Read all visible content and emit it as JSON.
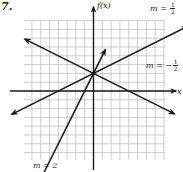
{
  "problem_number": "7.",
  "chart_data": {
    "type": "line",
    "title": "",
    "xlabel": "x",
    "ylabel": "f(x)",
    "grid": true,
    "xlim": [
      -8,
      8
    ],
    "ylim": [
      -8,
      8
    ],
    "y_intercept": 2,
    "series": [
      {
        "name": "m = 1/2",
        "slope": 0.5,
        "intercept": 2,
        "label_text": "m = ",
        "label_num": "1",
        "label_den": "2",
        "label_sign": ""
      },
      {
        "name": "m = -1/2",
        "slope": -0.5,
        "intercept": 2,
        "label_text": "m = −",
        "label_num": "1",
        "label_den": "2",
        "label_sign": "−"
      },
      {
        "name": "m = 2",
        "slope": 2,
        "intercept": 2,
        "label_text": "m = 2"
      }
    ]
  },
  "labels": {
    "y_axis": "f(x)",
    "x_axis": "x",
    "m_half": "m = ",
    "m_neg_half": "m = −",
    "m_two": "m = 2",
    "frac_num": "1",
    "frac_den": "2"
  },
  "colors": {
    "grid": "#b8b8b8",
    "axis": "#1a1a1a",
    "line": "#1a1a1a"
  }
}
